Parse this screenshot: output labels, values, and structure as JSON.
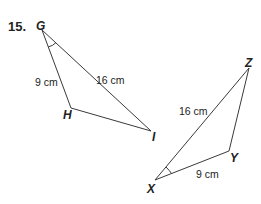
{
  "problem": {
    "number": "15.",
    "triangles": [
      {
        "name": "GHI",
        "vertices": {
          "G": "G",
          "H": "H",
          "I": "I"
        },
        "sides": {
          "GH": "9 cm",
          "GI": "16 cm"
        },
        "marked_angle": "G"
      },
      {
        "name": "XYZ",
        "vertices": {
          "X": "X",
          "Y": "Y",
          "Z": "Z"
        },
        "sides": {
          "XZ": "16 cm",
          "XY": "9 cm"
        },
        "marked_angle": "X"
      }
    ]
  },
  "colors": {
    "line": "#3a3a3a",
    "text": "#222222"
  }
}
